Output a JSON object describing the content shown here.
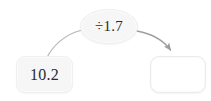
{
  "canvas": {
    "width": 211,
    "height": 101,
    "background": "#ffffff"
  },
  "diagram": {
    "type": "function-machine",
    "title": "",
    "input_node": {
      "label": "10.2",
      "shape": "rounded-rectangle",
      "fill": "#f6f6f6",
      "text_color": "#2b2b2b"
    },
    "operator_node": {
      "label": "÷1.7",
      "operator": "÷",
      "operand": "1.7",
      "shape": "ellipse",
      "fill": "#f6f6f6",
      "text_color": "#2b2b2b"
    },
    "output_node": {
      "label": "",
      "placeholder": "",
      "shape": "rounded-rectangle",
      "fill": "#ffffff",
      "text_color": "#2b2b2b"
    },
    "connectors": [
      {
        "name": "input-to-operator",
        "from": "input-box",
        "to": "operator-node",
        "style": "curved",
        "arrowhead": false,
        "color": "#b0b0b0"
      },
      {
        "name": "operator-to-output",
        "from": "operator-node",
        "to": "output-box",
        "style": "curved",
        "arrowhead": true,
        "color": "#9e9e9e"
      }
    ]
  }
}
